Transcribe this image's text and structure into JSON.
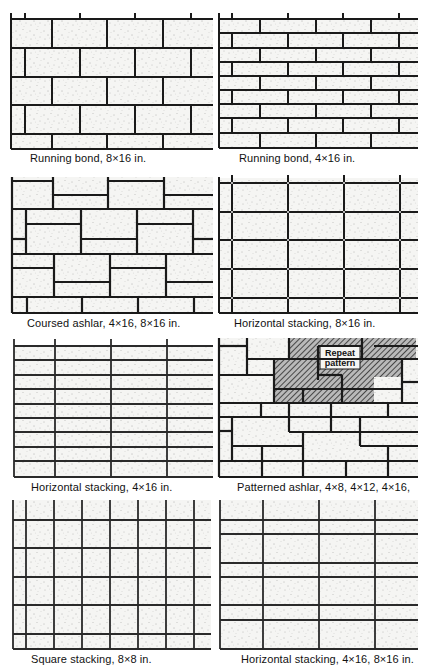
{
  "figure": {
    "panels": [
      {
        "id": "running-bond-8x16",
        "caption": "Running bond, 8×16 in.",
        "pattern": "running-bond",
        "unit_height_in": 8,
        "unit_length_in": 16,
        "courses": 5
      },
      {
        "id": "running-bond-4x16",
        "caption": "Running bond, 4×16 in.",
        "pattern": "running-bond",
        "unit_height_in": 4,
        "unit_length_in": 16,
        "courses": 9
      },
      {
        "id": "coursed-ashlar",
        "caption": "Coursed ashlar, 4×16, 8×16 in.",
        "pattern": "coursed-ashlar",
        "unit_sizes_in": [
          "4×16",
          "8×16"
        ]
      },
      {
        "id": "horizontal-stacking-8x16",
        "caption": "Horizontal stacking, 8×16 in.",
        "pattern": "stack-bond",
        "unit_height_in": 8,
        "unit_length_in": 16,
        "courses": 5
      },
      {
        "id": "horizontal-stacking-4x16",
        "caption": "Horizontal stacking, 4×16 in.",
        "pattern": "stack-bond",
        "unit_height_in": 4,
        "unit_length_in": 16,
        "courses": 9
      },
      {
        "id": "patterned-ashlar",
        "caption": "Patterned ashlar, 4×8, 4×12, 4×16,",
        "pattern": "patterned-ashlar",
        "callout": {
          "line1": "Repeat",
          "line2": "pattern"
        }
      },
      {
        "id": "square-stacking-8x8",
        "caption": "Square stacking, 8×8 in.",
        "pattern": "square-stack",
        "unit_height_in": 8,
        "unit_length_in": 8
      },
      {
        "id": "horizontal-stacking-4x16-8x16",
        "caption": "Horizontal stacking, 4×16, 8×16 in.",
        "pattern": "stack-bond-mixed",
        "unit_sizes_in": [
          "4×16",
          "8×16"
        ]
      }
    ]
  },
  "colors": {
    "joint": "#1a1a1a",
    "block_fill": "#f4f4f2",
    "hatch": "#333333",
    "caption_text": "#111111"
  }
}
